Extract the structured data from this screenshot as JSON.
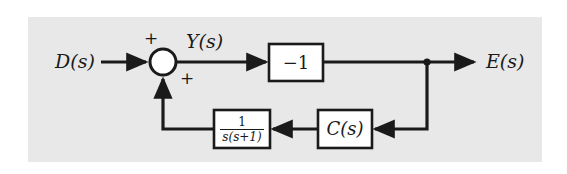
{
  "figure": {
    "type": "control-system-block-diagram",
    "background_color": "#ffffff",
    "panel_color": "#e8e8e8",
    "line_color": "#1a1a1a"
  },
  "signals": {
    "input_label": "D(s)",
    "intermediate_label": "Y(s)",
    "output_label": "E(s)"
  },
  "summing_junction": {
    "name": "summing-junction",
    "sign_top": "+",
    "sign_bottom": "+",
    "fill": "#ffffff"
  },
  "blocks": {
    "gain": {
      "label": "−1"
    },
    "controller": {
      "label": "C(s)"
    },
    "plant": {
      "numerator": "1",
      "denominator": "s(s+1)"
    }
  }
}
